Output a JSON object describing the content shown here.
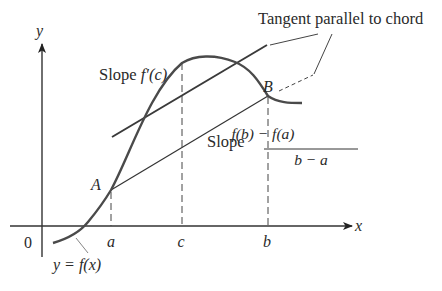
{
  "diagram": {
    "annotation_tangent": "Tangent parallel to chord",
    "slope_tangent_prefix": "Slope ",
    "slope_tangent_expr": "f′(c)",
    "slope_chord_prefix": "Slope",
    "slope_chord_numerator": "f(b) − f(a)",
    "slope_chord_denominator": "b − a",
    "point_a_label": "A",
    "point_b_label": "B",
    "axis_x_label": "x",
    "axis_y_label": "y",
    "origin_label": "0",
    "tick_a": "a",
    "tick_c": "c",
    "tick_b": "b",
    "curve_label": "y = f(x)",
    "colors": {
      "curve": "#4a4a4a",
      "lines": "#333333",
      "text": "#2a2a2a",
      "background": "#ffffff"
    }
  }
}
